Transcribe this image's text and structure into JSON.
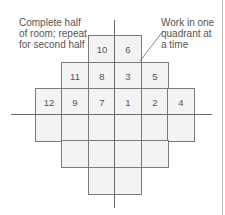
{
  "diagram": {
    "annotations": {
      "left": "Complete half\nof room; repeat\nfor second half",
      "right": "Work in one\nquadrant at\na time"
    },
    "grid": {
      "cell_width": 26.5,
      "cell_height": 26.5,
      "center_x": 114,
      "axis_y": 114,
      "rows": [
        {
          "top": 35,
          "start_col": -1,
          "cells": [
            "10",
            "6"
          ]
        },
        {
          "top": 62,
          "start_col": -2,
          "cells": [
            "11",
            "8",
            "3",
            "5"
          ]
        },
        {
          "top": 88,
          "start_col": -3,
          "cells": [
            "12",
            "9",
            "7",
            "1",
            "2",
            "4"
          ]
        },
        {
          "top": 114,
          "start_col": -3,
          "cells": [
            "",
            "",
            "",
            "",
            "",
            ""
          ]
        },
        {
          "top": 140,
          "start_col": -2,
          "cells": [
            "",
            "",
            "",
            ""
          ]
        },
        {
          "top": 167,
          "start_col": -1,
          "cells": [
            "",
            ""
          ]
        }
      ]
    },
    "colors": {
      "cell_fill": "#f3f3f3",
      "cell_border": "#7a7a7a",
      "axis": "#6a6a6a",
      "text": "#555555"
    }
  }
}
